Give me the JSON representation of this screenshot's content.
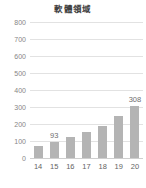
{
  "chart_data": {
    "type": "bar",
    "title": "軟體領域",
    "xlabel": "",
    "ylabel": "",
    "categories": [
      "14",
      "15",
      "16",
      "17",
      "18",
      "19",
      "20"
    ],
    "values": [
      70,
      93,
      123,
      155,
      190,
      250,
      308
    ],
    "data_labels": [
      null,
      "93",
      null,
      null,
      null,
      null,
      "308"
    ],
    "ylim": [
      0,
      800
    ],
    "yticks": [
      800,
      700,
      600,
      500,
      400,
      300,
      200,
      100,
      0
    ],
    "ytick_labels": [
      "800",
      "700",
      "600",
      "500",
      "400",
      "300",
      "200",
      "100",
      "0"
    ],
    "grid": true,
    "legend": false,
    "series": [
      {
        "name": "軟體領域",
        "values": [
          70,
          93,
          123,
          155,
          190,
          250,
          308
        ]
      }
    ],
    "colors": {
      "bar": "#b4b4b4",
      "gridline": "#e2e2e2",
      "axis": "#cfcfcf",
      "title_text": "#3f3f3f",
      "tick_text": "#868686",
      "label_text": "#6e6e6e",
      "background": "#ffffff"
    }
  }
}
